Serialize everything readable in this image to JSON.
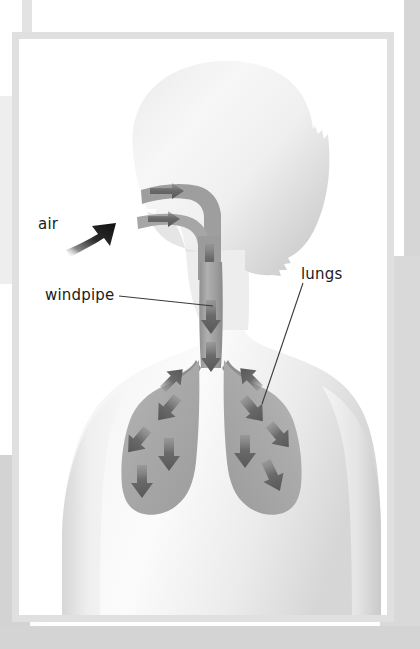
{
  "figure": {
    "kind": "anatomical-diagram",
    "labels": [
      {
        "id": "air",
        "text": "air",
        "pointer": "thick-black-arrow-into-mouth"
      },
      {
        "id": "windpipe",
        "text": "windpipe",
        "pointer": "leader-line-to-trachea"
      },
      {
        "id": "lungs",
        "text": "lungs",
        "pointer": "leader-line-to-right-lung"
      }
    ],
    "colors": {
      "page_white": "#ffffff",
      "frame_border": "#e0e0e0",
      "body_silhouette_light": "#f2f2f2",
      "body_silhouette_shadow": "#cfcfcf",
      "airway_gray": "#9a9a9a",
      "lung_gray": "#adadad",
      "arrow_gray": "#6e6e6e",
      "air_arrow_black": "#1c1c1c",
      "label_text": "#1b1b1b",
      "leader_line": "#3a3a3a",
      "page_surround_gray": "#d4d4d4"
    },
    "airflow": {
      "nasal_arrows": 2,
      "throat_arrows": 1,
      "trachea_arrows": 2,
      "left_lung_arrows": 5,
      "right_lung_arrows": 5,
      "direction": "inhalation — air travels in through nose and mouth, down the windpipe, and out into both lungs"
    }
  }
}
